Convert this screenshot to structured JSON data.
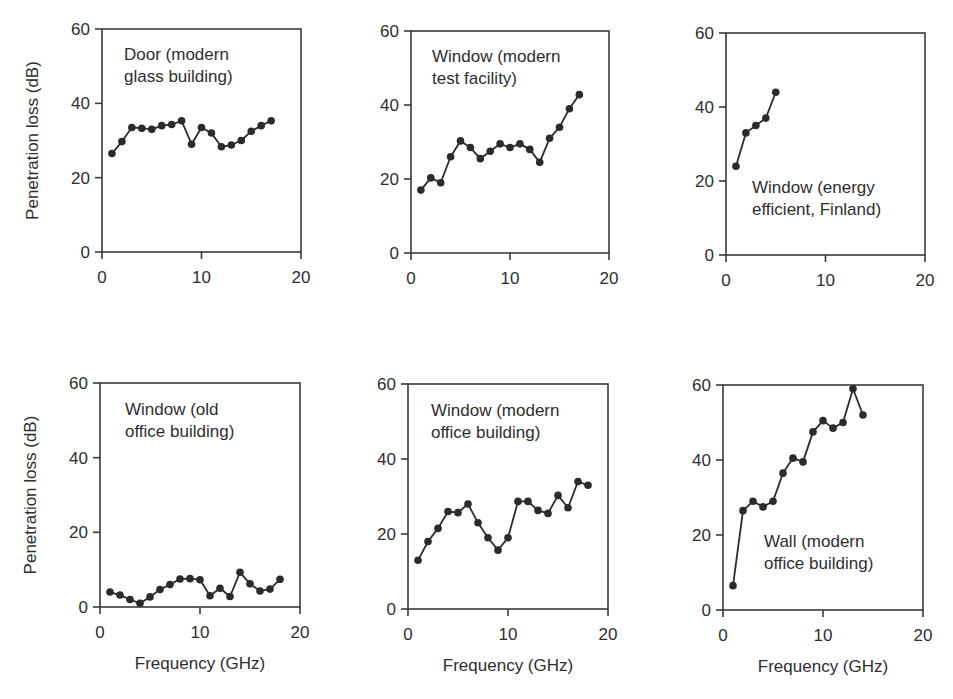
{
  "chart_data": [
    {
      "type": "line",
      "title": "Door (modern glass building)",
      "title_lines": [
        "Door (modern",
        "glass building)"
      ],
      "xlabel": "",
      "ylabel": "Penetration loss (dB)",
      "xlim": [
        0,
        20
      ],
      "ylim": [
        0,
        60
      ],
      "xticks": [
        0,
        10,
        20
      ],
      "yticks": [
        0,
        20,
        40,
        60
      ],
      "grid": false,
      "x": [
        1,
        2,
        3,
        4,
        5,
        6,
        7,
        8,
        9,
        10,
        11,
        12,
        13,
        14,
        15,
        16,
        17
      ],
      "values": [
        26.5,
        29.7,
        33.5,
        33.3,
        33,
        34,
        34.3,
        35.3,
        29,
        33.5,
        32,
        28.3,
        28.8,
        30,
        32.5,
        34,
        35.3
      ]
    },
    {
      "type": "line",
      "title": "Window (modern test facility)",
      "title_lines": [
        "Window (modern",
        "test facility)"
      ],
      "xlabel": "",
      "ylabel": "",
      "xlim": [
        0,
        20
      ],
      "ylim": [
        0,
        60
      ],
      "xticks": [
        0,
        10,
        20
      ],
      "yticks": [
        0,
        20,
        40,
        60
      ],
      "grid": false,
      "x": [
        1,
        2,
        3,
        4,
        5,
        6,
        7,
        8,
        9,
        10,
        11,
        12,
        13,
        14,
        15,
        16,
        17
      ],
      "values": [
        17,
        20.3,
        19,
        26,
        30.3,
        28.5,
        25.5,
        27.5,
        29.5,
        28.5,
        29.5,
        28,
        24.5,
        31,
        34,
        39,
        42.8
      ]
    },
    {
      "type": "line",
      "title": "Window (energy efficient, Finland)",
      "title_lines": [
        "Window (energy",
        "efficient, Finland)"
      ],
      "xlabel": "",
      "ylabel": "",
      "xlim": [
        0,
        20
      ],
      "ylim": [
        0,
        60
      ],
      "xticks": [
        0,
        10,
        20
      ],
      "yticks": [
        0,
        20,
        40,
        60
      ],
      "grid": false,
      "x": [
        1,
        2,
        3,
        4,
        5
      ],
      "values": [
        24,
        33,
        35,
        37,
        44
      ]
    },
    {
      "type": "line",
      "title": "Window (old office building)",
      "title_lines": [
        "Window (old",
        "office building)"
      ],
      "xlabel": "Frequency (GHz)",
      "ylabel": "Penetration loss (dB)",
      "xlim": [
        0,
        20
      ],
      "ylim": [
        0,
        60
      ],
      "xticks": [
        0,
        10,
        20
      ],
      "yticks": [
        0,
        20,
        40,
        60
      ],
      "grid": false,
      "x": [
        1,
        2,
        3,
        4,
        5,
        6,
        7,
        8,
        9,
        10,
        11,
        12,
        13,
        14,
        15,
        16,
        17,
        18
      ],
      "values": [
        4,
        3.2,
        2,
        1,
        2.7,
        4.7,
        6,
        7.5,
        7.6,
        7.3,
        3,
        5,
        2.8,
        9.3,
        6.2,
        4.3,
        4.8,
        7.4
      ]
    },
    {
      "type": "line",
      "title": "Window (modern office building)",
      "title_lines": [
        "Window (modern",
        "office building)"
      ],
      "xlabel": "Frequency (GHz)",
      "ylabel": "",
      "xlim": [
        0,
        20
      ],
      "ylim": [
        0,
        60
      ],
      "xticks": [
        0,
        10,
        20
      ],
      "yticks": [
        0,
        20,
        40,
        60
      ],
      "grid": false,
      "x": [
        1,
        2,
        3,
        4,
        5,
        6,
        7,
        8,
        9,
        10,
        11,
        12,
        13,
        14,
        15,
        16,
        17,
        18
      ],
      "values": [
        13,
        18,
        21.5,
        26,
        25.7,
        28,
        23,
        19,
        15.7,
        19,
        28.7,
        28.7,
        26.3,
        25.5,
        30.3,
        27,
        34,
        33
      ]
    },
    {
      "type": "line",
      "title": "Wall (modern office building)",
      "title_lines": [
        "Wall (modern",
        "office building)"
      ],
      "xlabel": "Frequency (GHz)",
      "ylabel": "",
      "xlim": [
        0,
        20
      ],
      "ylim": [
        0,
        60
      ],
      "xticks": [
        0,
        10,
        20
      ],
      "yticks": [
        0,
        20,
        40,
        60
      ],
      "grid": false,
      "x": [
        1,
        2,
        3,
        4,
        5,
        6,
        7,
        8,
        9,
        10,
        11,
        12,
        13,
        14
      ],
      "values": [
        6.5,
        26.5,
        29,
        27.5,
        29,
        36.5,
        40.5,
        39.5,
        47.5,
        50.5,
        48.5,
        50,
        59,
        52
      ]
    }
  ],
  "layout": {
    "panels": [
      {
        "left": 102,
        "right": 301,
        "top": 29,
        "bottom": 252,
        "title_x": 124,
        "title_y": 60,
        "text_anchor_row": "top"
      },
      {
        "left": 411,
        "right": 609,
        "top": 31,
        "bottom": 253,
        "title_x": 432,
        "title_y": 62,
        "text_anchor_row": "top"
      },
      {
        "left": 726,
        "right": 925,
        "top": 33,
        "bottom": 255,
        "title_x": 752,
        "title_y": 193,
        "text_anchor_row": "top"
      },
      {
        "left": 100,
        "right": 300,
        "top": 383,
        "bottom": 607,
        "title_x": 125,
        "title_y": 415,
        "text_anchor_row": "bottom"
      },
      {
        "left": 408,
        "right": 608,
        "top": 384,
        "bottom": 609,
        "title_x": 431,
        "title_y": 416,
        "text_anchor_row": "bottom"
      },
      {
        "left": 723,
        "right": 923,
        "top": 385,
        "bottom": 610,
        "title_x": 764,
        "title_y": 547,
        "text_anchor_row": "bottom"
      }
    ],
    "line_color": "#2b2b2b",
    "marker_color": "#2b2b2b",
    "frame_color": "#3a3a3a"
  }
}
